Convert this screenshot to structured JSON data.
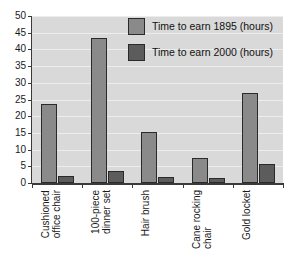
{
  "chart_data": {
    "type": "bar",
    "title": "",
    "xlabel": "",
    "ylabel": "",
    "ylim": [
      0,
      50
    ],
    "yticks": [
      0,
      5,
      10,
      15,
      20,
      25,
      30,
      35,
      40,
      45,
      50
    ],
    "grid": true,
    "legend_position": "top-right",
    "categories": [
      "Cushioned\noffice chair",
      "100-piece\ndinner set",
      "Hair brush",
      "Cane rocking\nchair",
      "Gold locket"
    ],
    "series": [
      {
        "name": "Time to earn 1895 (hours)",
        "color": "#8a8a8a",
        "values": [
          23.7,
          43.5,
          15.3,
          7.6,
          27.0
        ]
      },
      {
        "name": "Time to earn 2000 (hours)",
        "color": "#5c5c5c",
        "values": [
          2.0,
          3.5,
          1.7,
          1.4,
          5.8
        ]
      }
    ]
  },
  "legend": {
    "items": [
      {
        "label": "Time to earn 1895 (hours)",
        "color": "#8a8a8a"
      },
      {
        "label": "Time to earn 2000 (hours)",
        "color": "#5c5c5c"
      }
    ]
  },
  "colors": {
    "plot_background": "#d9d9d9",
    "gridline": "#ededed",
    "axis": "#3a3a3a",
    "series_1895": "#8a8a8a",
    "series_2000": "#5c5c5c",
    "page_background": "#ffffff"
  }
}
